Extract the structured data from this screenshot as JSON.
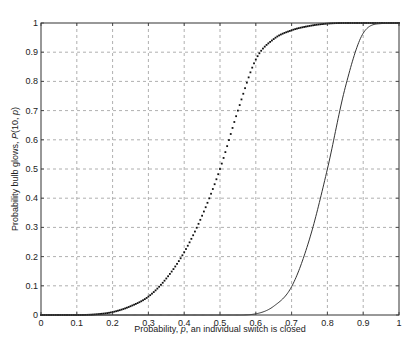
{
  "chart_data": {
    "type": "line",
    "title": "",
    "xlabel": "Probability, p, an individual switch is closed",
    "ylabel": "Probability bulb glows, P(10, p)",
    "xlim": [
      0,
      1
    ],
    "ylim": [
      0,
      1
    ],
    "grid": true,
    "legend": null,
    "x_ticks": [
      "0",
      "0.1",
      "0.2",
      "0.3",
      "0.4",
      "0.5",
      "0.6",
      "0.7",
      "0.8",
      "0.9",
      "1"
    ],
    "y_ticks": [
      "0",
      "0.1",
      "0.2",
      "0.3",
      "0.4",
      "0.5",
      "0.6",
      "0.7",
      "0.8",
      "0.9",
      "1"
    ],
    "x": [
      0,
      0.1,
      0.15,
      0.2,
      0.25,
      0.3,
      0.35,
      0.4,
      0.45,
      0.5,
      0.55,
      0.6,
      0.65,
      0.7,
      0.75,
      0.8,
      0.85,
      0.9,
      0.95,
      1.0
    ],
    "series": [
      {
        "name": "dotted curve",
        "style": "dotted",
        "values": [
          0,
          0.0,
          0.002,
          0.01,
          0.03,
          0.063,
          0.125,
          0.215,
          0.34,
          0.5,
          0.7,
          0.875,
          0.945,
          0.975,
          0.99,
          0.998,
          1.0,
          1.0,
          1.0,
          1.0
        ]
      },
      {
        "name": "solid curve",
        "style": "solid",
        "values": [
          0,
          0,
          0,
          0,
          0,
          0,
          0,
          0,
          0,
          0,
          0.0,
          0.004,
          0.03,
          0.097,
          0.26,
          0.5,
          0.78,
          0.965,
          0.998,
          1.0
        ]
      }
    ]
  },
  "labels": {
    "xlabel_prefix": "Probability, ",
    "xlabel_var": "p",
    "xlabel_suffix": ", an individual switch is closed",
    "ylabel_prefix": "Probability bulb glows, ",
    "ylabel_var": "P",
    "ylabel_mid": "(10, ",
    "ylabel_var2": "p",
    "ylabel_suffix": ")"
  }
}
